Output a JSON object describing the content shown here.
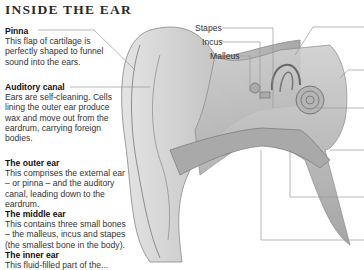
{
  "title": "INSIDE THE EAR",
  "sections": {
    "pinna": {
      "heading": "Pinna",
      "text": "This flap of cartilage is perfectly shaped to funnel sound into the ears."
    },
    "auditory_canal": {
      "heading": "Auditory canal",
      "text": "Ears are self-cleaning. Cells lining the outer ear produce wax and move out from the eardrum, carrying foreign bodies."
    },
    "outer_ear": {
      "heading": "The outer ear",
      "text": "This comprises the external ear – or pinna – and the auditory canal, leading down to the eardrum."
    },
    "middle_ear": {
      "heading": "The middle ear",
      "text": "This contains three small bones – the malleus, incus and stapes (the smallest bone in the body)."
    },
    "inner_ear": {
      "heading": "The inner ear",
      "text": "This fluid-filled part of the..."
    }
  },
  "labels": {
    "stapes": "Stapes",
    "incus": "Incus",
    "malleus": "Malleus"
  },
  "illustration": {
    "subject": "cross-section-of-human-ear",
    "colors": {
      "line": "#8a8a8a",
      "tissue": "#bdbdbd",
      "shade": "#9a9a9a",
      "text": "#333333"
    }
  }
}
